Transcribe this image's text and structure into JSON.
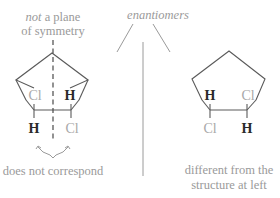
{
  "diagram": {
    "title": "enantiomers",
    "left_structure": {
      "annotation_top": {
        "emphasis": "not",
        "rest_line1": " a plane",
        "line2": "of symmetry"
      },
      "substituents": {
        "top_left": "Cl",
        "top_right": "H",
        "bottom_left": "H",
        "bottom_right": "Cl"
      },
      "annotation_bottom": "does not correspond"
    },
    "right_structure": {
      "substituents": {
        "top_left": "H",
        "top_right": "Cl",
        "bottom_left": "Cl",
        "bottom_right": "H"
      },
      "annotation_bottom": {
        "line1": "different from the",
        "line2": "structure at left"
      }
    },
    "colors": {
      "bond": "#5a5a5a",
      "light_text": "#a8a8a8",
      "dark_text": "#2a2a2a"
    }
  }
}
